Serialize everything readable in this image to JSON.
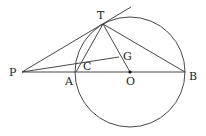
{
  "diagram": {
    "type": "geometry",
    "stroke_color": "#333333",
    "circle": {
      "center": "O",
      "cx": 130,
      "cy": 72,
      "r": 55
    },
    "points": {
      "P": {
        "x": 22,
        "y": 72,
        "label": "P",
        "lx": 9,
        "ly": 76
      },
      "A": {
        "x": 76,
        "y": 72,
        "label": "A",
        "lx": 65,
        "ly": 85
      },
      "O": {
        "x": 130,
        "y": 72,
        "label": "O",
        "lx": 127,
        "ly": 85
      },
      "B": {
        "x": 185,
        "y": 72,
        "label": "B",
        "lx": 189,
        "ly": 80
      },
      "T": {
        "x": 103,
        "y": 24,
        "label": "T",
        "lx": 97,
        "ly": 19
      },
      "G": {
        "x": 119,
        "y": 57,
        "label": "G",
        "lx": 123,
        "ly": 60
      },
      "C": {
        "x": 77,
        "y": 64,
        "label": "C",
        "lx": 83,
        "ly": 70
      }
    },
    "segments": [
      [
        "P",
        "B"
      ],
      [
        "P",
        "T"
      ],
      [
        "T",
        "A"
      ],
      [
        "T",
        "O"
      ],
      [
        "T",
        "B"
      ],
      [
        "P",
        "G"
      ]
    ],
    "tangent_extension": {
      "from": "T",
      "to_x": 131,
      "to_y": 7
    }
  }
}
